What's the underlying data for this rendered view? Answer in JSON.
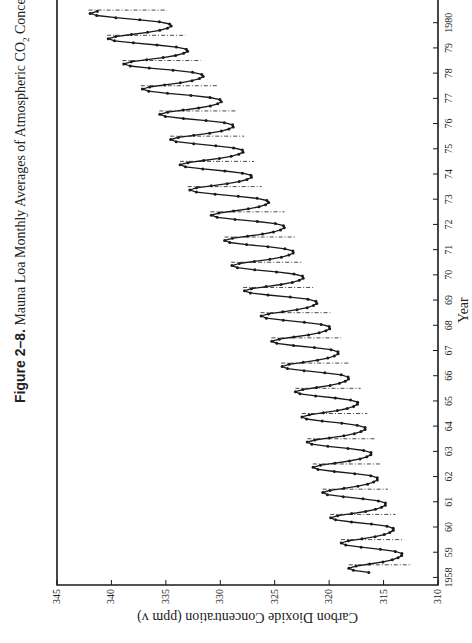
{
  "caption": {
    "figure_number": "Figure 2–8.",
    "text_before_sub": "Mauna Loa Monthly Averages of Atmospheric CO",
    "subscript": "2",
    "text_after_sub": " Concentrations."
  },
  "colors": {
    "ink": "#1a1a1a",
    "background": "#ffffff"
  },
  "chart_data": {
    "type": "line",
    "title": "Mauna Loa Monthly Averages of Atmospheric CO2 Concentrations",
    "xlabel": "Year",
    "ylabel": "Carbon Dioxide Concentration (ppm v)",
    "xlim": [
      1957.7,
      1980.9
    ],
    "ylim": [
      310,
      345
    ],
    "x_ticks": [
      1958,
      1959,
      1960,
      1961,
      1962,
      1963,
      1964,
      1965,
      1966,
      1967,
      1968,
      1969,
      1970,
      1971,
      1972,
      1973,
      1974,
      1975,
      1976,
      1977,
      1978,
      1979,
      1980
    ],
    "x_tick_labels": [
      "1958",
      "59",
      "60",
      "61",
      "62",
      "63",
      "64",
      "65",
      "66",
      "67",
      "68",
      "69",
      "70",
      "71",
      "72",
      "73",
      "74",
      "75",
      "76",
      "77",
      "78",
      "79",
      "1980"
    ],
    "y_ticks": [
      310,
      315,
      320,
      325,
      330,
      335,
      340,
      345
    ],
    "y_tick_labels": [
      "310",
      "315",
      "320",
      "325",
      "330",
      "335",
      "340",
      "345"
    ],
    "grid": false,
    "legend": null,
    "rotation": "figure rotated 90° counter-clockwise on page",
    "series": [
      {
        "name": "Monthly average CO2 (ppm)",
        "style": "line-with-dot-markers",
        "start": 1958.2,
        "seasonal_amplitude": [
          2.6,
          2.6,
          2.7,
          2.7,
          2.8,
          2.8,
          2.7,
          2.7,
          2.8,
          2.9,
          2.9,
          3.0,
          3.0,
          3.0,
          3.1,
          3.1,
          3.1,
          3.1,
          3.2,
          3.2,
          3.3,
          3.3,
          3.3
        ],
        "annual_means": [
          {
            "year": 1958,
            "value": 315.3
          },
          {
            "year": 1959,
            "value": 316.0
          },
          {
            "year": 1960,
            "value": 316.9
          },
          {
            "year": 1961,
            "value": 317.6
          },
          {
            "year": 1962,
            "value": 318.4
          },
          {
            "year": 1963,
            "value": 318.9
          },
          {
            "year": 1964,
            "value": 319.5
          },
          {
            "year": 1965,
            "value": 320.1
          },
          {
            "year": 1966,
            "value": 321.3
          },
          {
            "year": 1967,
            "value": 322.1
          },
          {
            "year": 1968,
            "value": 323.1
          },
          {
            "year": 1969,
            "value": 324.6
          },
          {
            "year": 1970,
            "value": 325.7
          },
          {
            "year": 1971,
            "value": 326.3
          },
          {
            "year": 1972,
            "value": 327.5
          },
          {
            "year": 1973,
            "value": 329.6
          },
          {
            "year": 1974,
            "value": 330.3
          },
          {
            "year": 1975,
            "value": 331.2
          },
          {
            "year": 1976,
            "value": 332.1
          },
          {
            "year": 1977,
            "value": 333.8
          },
          {
            "year": 1978,
            "value": 335.4
          },
          {
            "year": 1979,
            "value": 336.8
          },
          {
            "year": 1980,
            "value": 338.5
          }
        ]
      },
      {
        "name": "Annual mean (dashed vertical markers)",
        "style": "dash-dot segments through each annual cycle"
      }
    ]
  }
}
